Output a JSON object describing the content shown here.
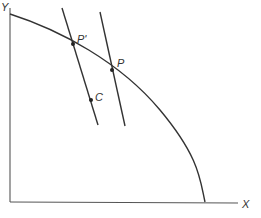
{
  "diagram": {
    "axes": {
      "y_label": "Y",
      "x_label": "X"
    },
    "points": {
      "p": "P",
      "p_prime": "P'",
      "c": "C"
    },
    "elements": [
      "Y axis (vertical)",
      "X axis (horizontal)",
      "concave-down boundary curve from Y axis to X axis",
      "line through P' and C",
      "parallel line through P"
    ],
    "colors": {
      "stroke": "#333333",
      "axis": "#555555",
      "background": "#ffffff"
    }
  }
}
